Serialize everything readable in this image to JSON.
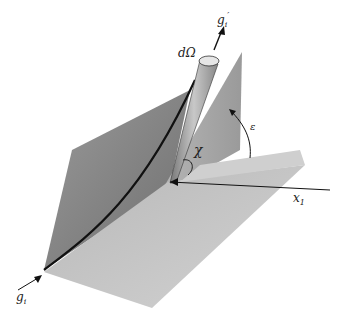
{
  "diagram": {
    "labels": {
      "d_omega": "dΩ",
      "g_prime": "g",
      "g_prime_sub": "i",
      "g_prime_mark": "′",
      "chi": "χ",
      "epsilon": "ε",
      "x1": "x",
      "x1_sub": "1",
      "g_i": "g",
      "g_i_sub": "i"
    },
    "colors": {
      "background": "#ffffff",
      "plane_dark": "#8a8a8a",
      "plane_light": "#c4c4c4",
      "vertical_plane": "#a8a8a8",
      "ink": "#222222"
    }
  }
}
